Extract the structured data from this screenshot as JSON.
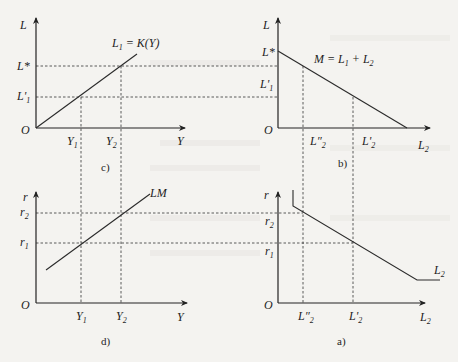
{
  "figure": {
    "type": "four-quadrant IS-LM / money market derivation diagram",
    "panels": {
      "c": {
        "caption": "c)",
        "y_axis_label": "L",
        "x_axis_label": "Y",
        "origin_label": "O",
        "curve_label": "L₁ = K(Y)",
        "y_ticks": [
          "L*",
          "L'₁"
        ],
        "x_ticks": [
          "Y₁",
          "Y₂"
        ]
      },
      "b": {
        "caption": "b)",
        "y_axis_label": "L",
        "x_axis_label": "L₂",
        "origin_label": "O",
        "curve_label": "M = L₁ + L₂",
        "y_ticks": [
          "L*",
          "L'₁"
        ],
        "x_ticks": [
          "L″₂",
          "L'₂"
        ]
      },
      "d": {
        "caption": "d)",
        "y_axis_label": "r",
        "x_axis_label": "Y",
        "origin_label": "O",
        "curve_label": "LM",
        "y_ticks": [
          "r₂",
          "r₁"
        ],
        "x_ticks": [
          "Y₁",
          "Y₂"
        ]
      },
      "a": {
        "caption": "a)",
        "y_axis_label": "r",
        "x_axis_label": "L₂",
        "origin_label": "O",
        "curve_label": "L₂",
        "y_ticks": [
          "r₂",
          "r₁"
        ],
        "x_ticks": [
          "L″₂",
          "L'₂"
        ]
      }
    }
  },
  "labels": {
    "c_L": "L",
    "c_O": "O",
    "c_Y": "Y",
    "c_curve_main": "L",
    "c_curve_sub": "1",
    "c_curve_rest": " = K(Y)",
    "c_Lstar": "L*",
    "c_L1p_main": "L'",
    "c_L1p_sub": "1",
    "c_Y1_main": "Y",
    "c_Y1_sub": "1",
    "c_Y2_main": "Y",
    "c_Y2_sub": "2",
    "c_cap": "c)",
    "b_L": "L",
    "b_O": "O",
    "b_Lstar": "L*",
    "b_L1p_main": "L'",
    "b_L1p_sub": "1",
    "b_curve_a": "M = L",
    "b_curve_sub1": "1",
    "b_curve_b": " + L",
    "b_curve_sub2": "2",
    "b_L2pp_main": "L″",
    "b_L2pp_sub": "2",
    "b_L2p_main": "L'",
    "b_L2p_sub": "2",
    "b_L2_main": "L",
    "b_L2_sub": "2",
    "b_cap": "b)",
    "d_r": "r",
    "d_O": "O",
    "d_Y": "Y",
    "d_LM": "LM",
    "d_r2_main": "r",
    "d_r2_sub": "2",
    "d_r1_main": "r",
    "d_r1_sub": "1",
    "d_Y1_main": "Y",
    "d_Y1_sub": "1",
    "d_Y2_main": "Y",
    "d_Y2_sub": "2",
    "d_cap": "d)",
    "a_r": "r",
    "a_O": "O",
    "a_r2_main": "r",
    "a_r2_sub": "2",
    "a_r1_main": "r",
    "a_r1_sub": "1",
    "a_L2pp_main": "L″",
    "a_L2pp_sub": "2",
    "a_L2p_main": "L'",
    "a_L2p_sub": "2",
    "a_L2x_main": "L",
    "a_L2x_sub": "2",
    "a_curve_main": "L",
    "a_curve_sub": "2",
    "a_cap": "a)"
  }
}
